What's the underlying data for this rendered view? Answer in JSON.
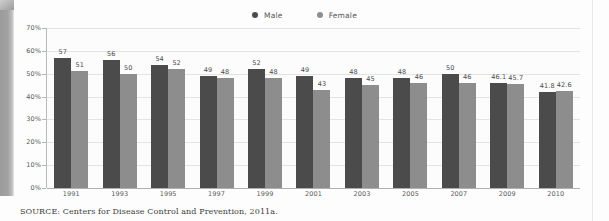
{
  "legend": {
    "entries": [
      {
        "label": "Male",
        "color": "#4b4b4b"
      },
      {
        "label": "Female",
        "color": "#8d8d8d"
      }
    ]
  },
  "caption": {
    "text": "SOURCE: Centers for Disease Control and Prevention, 2011a."
  },
  "chart_data": {
    "type": "bar",
    "title": "",
    "subtitle": "",
    "xlabel": "",
    "ylabel": "",
    "ylim": [
      0,
      70
    ],
    "y_tick_labels": [
      "0%",
      "10%",
      "20%",
      "30%",
      "40%",
      "50%",
      "60%",
      "70%"
    ],
    "y_ticks": [
      0,
      10,
      20,
      30,
      40,
      50,
      60,
      70
    ],
    "grid": true,
    "legend_position": "top-center",
    "categories": [
      "1991",
      "1993",
      "1995",
      "1997",
      "1999",
      "2001",
      "2003",
      "2005",
      "2007",
      "2009",
      "2010"
    ],
    "series": [
      {
        "name": "Male",
        "color": "#4b4b4b",
        "values": [
          57,
          56,
          54,
          49,
          52,
          49,
          48,
          48,
          50,
          46.1,
          41.8
        ],
        "labels": [
          "57",
          "56",
          "54",
          "49",
          "52",
          "49",
          "48",
          "48",
          "50",
          "46.1",
          "41.8"
        ]
      },
      {
        "name": "Female",
        "color": "#8d8d8d",
        "values": [
          51,
          50,
          52,
          48,
          48,
          43,
          45,
          46,
          46,
          45.7,
          42.6
        ],
        "labels": [
          "51",
          "50",
          "52",
          "48",
          "48",
          "43",
          "45",
          "46",
          "46",
          "45.7",
          "42.6"
        ]
      }
    ]
  }
}
